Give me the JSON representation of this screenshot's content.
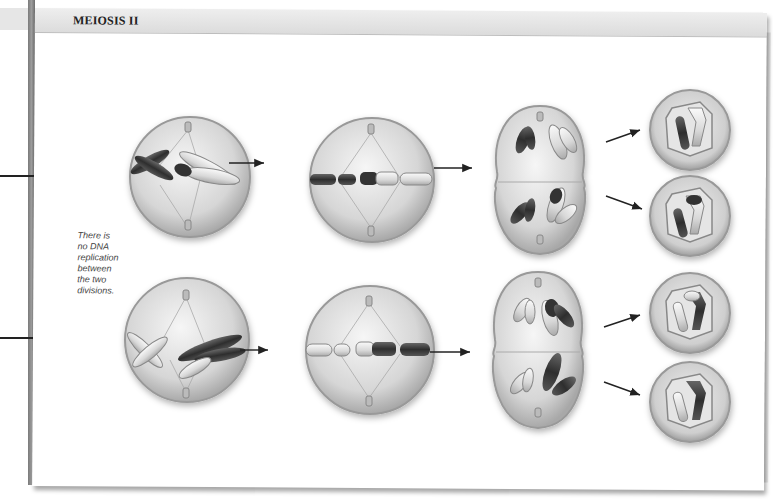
{
  "figure": {
    "section_title": "MEIOSIS II",
    "note_lines": [
      "There is",
      "no DNA",
      "replication",
      "between",
      "the two",
      "divisions."
    ],
    "rows": [
      {
        "name": "top-lineage",
        "stages": [
          "prophase-II",
          "metaphase-II",
          "anaphase-telophase-II",
          "daughter-cells"
        ],
        "daughter_cells": 2
      },
      {
        "name": "bottom-lineage",
        "stages": [
          "prophase-II",
          "metaphase-II",
          "anaphase-telophase-II",
          "daughter-cells"
        ],
        "daughter_cells": 2
      }
    ],
    "colors": {
      "dark_chromosome": "#3a3a3a",
      "light_chromosome": "#e2e2e2",
      "cell_fill": "#d9d9d9",
      "cell_edge": "#9a9a9a",
      "header_bar": "#e3e3e3",
      "spine": "#888888"
    }
  }
}
